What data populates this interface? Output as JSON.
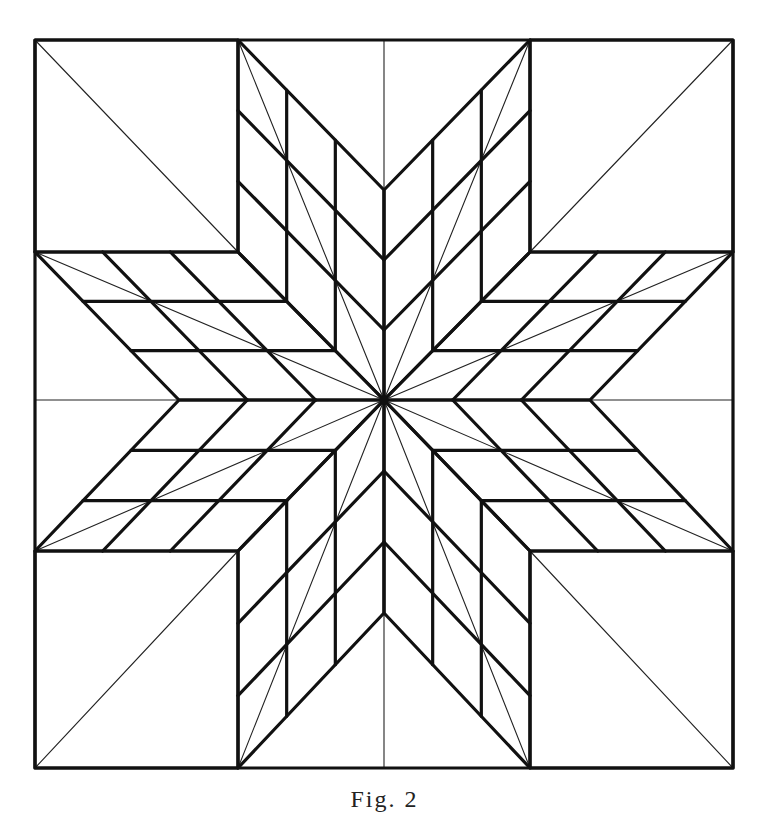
{
  "figure": {
    "caption": "Fig. 2",
    "colors": {
      "stroke": "#111111",
      "background": "#ffffff"
    },
    "center": [
      384,
      400
    ],
    "outer_square": {
      "x1": 35,
      "y1": 40,
      "x2": 733,
      "y2": 768
    },
    "corner_squares": [
      {
        "name": "top-left",
        "x1": 35,
        "y1": 40,
        "x2": 238,
        "y2": 252,
        "diagonal": [
          [
            35,
            40
          ],
          [
            238,
            252
          ]
        ]
      },
      {
        "name": "top-right",
        "x1": 530,
        "y1": 40,
        "x2": 733,
        "y2": 252,
        "diagonal": [
          [
            733,
            40
          ],
          [
            530,
            252
          ]
        ]
      },
      {
        "name": "bottom-right",
        "x1": 530,
        "y1": 551,
        "x2": 733,
        "y2": 768,
        "diagonal": [
          [
            733,
            768
          ],
          [
            530,
            551
          ]
        ]
      },
      {
        "name": "bottom-left",
        "x1": 35,
        "y1": 551,
        "x2": 238,
        "y2": 768,
        "diagonal": [
          [
            35,
            768
          ],
          [
            238,
            551
          ]
        ]
      }
    ],
    "axis_lines": [
      [
        [
          384,
          40
        ],
        [
          384,
          190
        ]
      ],
      [
        [
          590,
          400
        ],
        [
          733,
          400
        ]
      ],
      [
        [
          384,
          613
        ],
        [
          384,
          768
        ]
      ],
      [
        [
          35,
          400
        ],
        [
          179,
          400
        ]
      ]
    ],
    "diamond_subdivisions": 3,
    "diamonds": [
      {
        "name": "north-west-arm",
        "points": [
          [
            384,
            400
          ],
          [
            238,
            252
          ],
          [
            238,
            40
          ],
          [
            384,
            190
          ]
        ]
      },
      {
        "name": "north-east-arm",
        "points": [
          [
            384,
            400
          ],
          [
            384,
            190
          ],
          [
            530,
            40
          ],
          [
            530,
            252
          ]
        ]
      },
      {
        "name": "east-north-arm",
        "points": [
          [
            384,
            400
          ],
          [
            530,
            252
          ],
          [
            733,
            252
          ],
          [
            590,
            400
          ]
        ]
      },
      {
        "name": "east-south-arm",
        "points": [
          [
            384,
            400
          ],
          [
            590,
            400
          ],
          [
            733,
            551
          ],
          [
            530,
            551
          ]
        ]
      },
      {
        "name": "south-east-arm",
        "points": [
          [
            384,
            400
          ],
          [
            530,
            551
          ],
          [
            530,
            768
          ],
          [
            384,
            613
          ]
        ]
      },
      {
        "name": "south-west-arm",
        "points": [
          [
            384,
            400
          ],
          [
            384,
            613
          ],
          [
            238,
            768
          ],
          [
            238,
            551
          ]
        ]
      },
      {
        "name": "west-south-arm",
        "points": [
          [
            384,
            400
          ],
          [
            238,
            551
          ],
          [
            35,
            551
          ],
          [
            179,
            400
          ]
        ]
      },
      {
        "name": "west-north-arm",
        "points": [
          [
            384,
            400
          ],
          [
            179,
            400
          ],
          [
            35,
            252
          ],
          [
            238,
            252
          ]
        ]
      }
    ]
  }
}
